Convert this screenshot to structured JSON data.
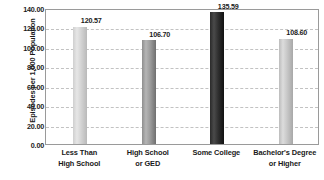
{
  "chart_data": {
    "type": "bar",
    "title": "",
    "xlabel": "",
    "ylabel": "Episodes per 1,000 Population",
    "categories": [
      "Less Than High School",
      "High School or GED",
      "Some College",
      "Bachelor's Degree or Higher"
    ],
    "category_lines": [
      [
        "Less Than",
        "High School"
      ],
      [
        "High School",
        "or GED"
      ],
      [
        "Some College",
        ""
      ],
      [
        "Bachelor's Degree",
        "or Higher"
      ]
    ],
    "values": [
      120.57,
      106.7,
      135.59,
      108.6
    ],
    "value_labels": [
      "120.57",
      "106.70",
      "135.59",
      "108.60"
    ],
    "bar_colors": [
      "#d2d2d2",
      "#9a9a9a",
      "#2e2e2e",
      "#c6c6c6"
    ],
    "bar_styles": [
      "bar-lightest",
      "bar-medium",
      "bar-dark",
      "bar-light"
    ],
    "ylim": [
      0,
      140
    ],
    "ytick_values": [
      0,
      20,
      40,
      60,
      80,
      100,
      120,
      140
    ],
    "ytick_labels": [
      "0.00",
      "20.00",
      "40.00",
      "60.00",
      "80.00",
      "100.00",
      "120.00",
      "140.00"
    ],
    "grid": true,
    "grid_axis": "y",
    "grid_style": "dashed",
    "grid_color": "#c2c2c2",
    "legend": "none",
    "plot_border_color": "#9a9a9a",
    "background_color": "#ffffff",
    "text_color": "#1a1a1a"
  }
}
